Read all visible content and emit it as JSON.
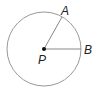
{
  "diagram": {
    "type": "circle-geometry",
    "center": {
      "label": "P",
      "x": 44,
      "y": 49
    },
    "radius": 37,
    "points": [
      {
        "label": "A",
        "x": 62,
        "y": 17
      },
      {
        "label": "B",
        "x": 81,
        "y": 49
      }
    ],
    "segments": [
      [
        "P",
        "A"
      ],
      [
        "P",
        "B"
      ]
    ],
    "colors": {
      "circle": "#999999",
      "segment": "#888888",
      "center": "#111111",
      "text": "#222222"
    }
  }
}
